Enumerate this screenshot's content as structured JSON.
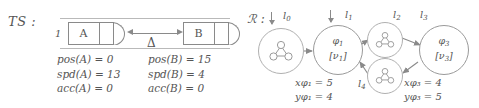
{
  "figure": {
    "left_panel": {
      "label": "TS :",
      "lane_index": "1",
      "cars": [
        {
          "name": "A",
          "icon": "car-icon"
        },
        {
          "name": "B",
          "icon": "car-icon"
        }
      ],
      "gap_symbol": "Δ",
      "gap_arrow_icon": "double-headed-arrow-icon",
      "car_a_equations": [
        "pos(A) = 0",
        "spd(A) = 13",
        "acc(A) = 0"
      ],
      "car_b_equations": [
        "pos(B) = 15",
        "spd(B) = 4",
        "acc(B) = 0"
      ]
    },
    "right_panel": {
      "label": "ℛ :",
      "nodes": [
        {
          "id": "n0",
          "formula": "",
          "valuation": "",
          "icon": "graph-motif-icon"
        },
        {
          "id": "n1",
          "formula": "φ",
          "formula_sub": "1",
          "valuation": "[ν",
          "valuation_sub": "1",
          "valuation_close": "]"
        },
        {
          "id": "n2",
          "formula": "",
          "valuation": "",
          "icon": "graph-motif-icon"
        },
        {
          "id": "n4",
          "formula": "",
          "valuation": "",
          "icon": "graph-motif-icon"
        },
        {
          "id": "n3",
          "formula": "φ",
          "formula_sub": "3",
          "valuation": "[ν",
          "valuation_sub": "3",
          "valuation_close": "]"
        }
      ],
      "edge_labels": {
        "l0": "l",
        "l0_sub": "0",
        "l1": "l",
        "l1_sub": "1",
        "l2": "l",
        "l2_sub": "2",
        "l3": "l",
        "l3_sub": "3",
        "l4": "l",
        "l4_sub": "4"
      },
      "node1_constraints": [
        {
          "var": "x",
          "sub": "φ₁",
          "value": "5"
        },
        {
          "var": "y",
          "sub": "φ₁",
          "value": "4"
        }
      ],
      "node3_constraints": [
        {
          "var": "x",
          "sub": "φ₃",
          "value": "4"
        },
        {
          "var": "y",
          "sub": "φ₃",
          "value": "5"
        }
      ],
      "node1_constraint_lines": [
        "xφ₁ = 5",
        "yφ₁ = 4"
      ],
      "node3_constraint_lines": [
        "xφ₃ = 4",
        "yφ₃ = 5"
      ]
    },
    "colors": {
      "stroke": "#8a8a8a",
      "light_stroke": "#b0b0b0",
      "text": "#555555",
      "background": "#ffffff"
    }
  }
}
